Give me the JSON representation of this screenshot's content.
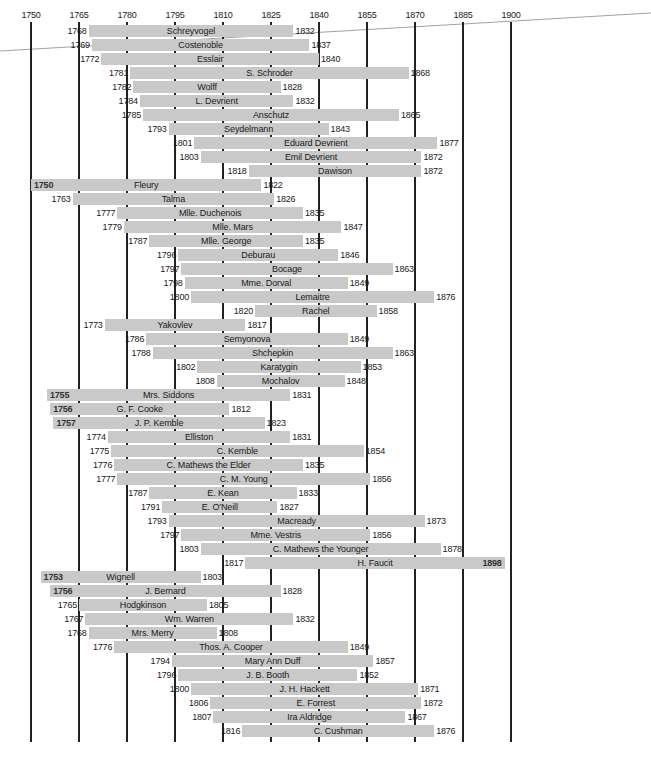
{
  "chart_data": {
    "type": "bar",
    "orientation": "horizontal-range (Gantt/lifespan timeline)",
    "title": "",
    "xlabel": "",
    "ylabel": "",
    "xlim": [
      1750,
      1900
    ],
    "x_ticks": [
      1750,
      1765,
      1780,
      1795,
      1810,
      1825,
      1840,
      1855,
      1870,
      1885,
      1900
    ],
    "grid": "vertical lines at each tick",
    "bar_color": "#c9c9c9",
    "legend": null,
    "rows": [
      {
        "name": "Schreyvogel",
        "start": 1768,
        "end": 1832
      },
      {
        "name": "Costenoble",
        "start": 1769,
        "end": 1837
      },
      {
        "name": "Esslair",
        "start": 1772,
        "end": 1840
      },
      {
        "name": "S. Schroder",
        "start": 1781,
        "end": 1868
      },
      {
        "name": "Wolff",
        "start": 1782,
        "end": 1828
      },
      {
        "name": "L. Devrient",
        "start": 1784,
        "end": 1832
      },
      {
        "name": "Anschutz",
        "start": 1785,
        "end": 1865
      },
      {
        "name": "Seydelmann",
        "start": 1793,
        "end": 1843
      },
      {
        "name": "Eduard Devrient",
        "start": 1801,
        "end": 1877
      },
      {
        "name": "Emil Devrient",
        "start": 1803,
        "end": 1872
      },
      {
        "name": "Dawison",
        "start": 1818,
        "end": 1872
      },
      {
        "name": "Fleury",
        "start": 1750,
        "end": 1822,
        "start_inside": true
      },
      {
        "name": "Talma",
        "start": 1763,
        "end": 1826
      },
      {
        "name": "Mlle. Duchenois",
        "start": 1777,
        "end": 1835
      },
      {
        "name": "Mlle. Mars",
        "start": 1779,
        "end": 1847
      },
      {
        "name": "Mlle. George",
        "start": 1787,
        "end": 1835
      },
      {
        "name": "Deburau",
        "start": 1796,
        "end": 1846
      },
      {
        "name": "Bocage",
        "start": 1797,
        "end": 1863
      },
      {
        "name": "Mme. Dorval",
        "start": 1798,
        "end": 1849
      },
      {
        "name": "Lemaitre",
        "start": 1800,
        "end": 1876
      },
      {
        "name": "Rachel",
        "start": 1820,
        "end": 1858
      },
      {
        "name": "Yakovlev",
        "start": 1773,
        "end": 1817
      },
      {
        "name": "Semyonova",
        "start": 1786,
        "end": 1849
      },
      {
        "name": "Shchepkin",
        "start": 1788,
        "end": 1863
      },
      {
        "name": "Karatygin",
        "start": 1802,
        "end": 1853
      },
      {
        "name": "Mochalov",
        "start": 1808,
        "end": 1848
      },
      {
        "name": "Mrs. Siddons",
        "start": 1755,
        "end": 1831,
        "start_inside": true
      },
      {
        "name": "G. F. Cooke",
        "start": 1756,
        "end": 1812,
        "start_inside": true
      },
      {
        "name": "J. P. Kemble",
        "start": 1757,
        "end": 1823,
        "start_inside": true
      },
      {
        "name": "Elliston",
        "start": 1774,
        "end": 1831
      },
      {
        "name": "C. Kemble",
        "start": 1775,
        "end": 1854
      },
      {
        "name": "C. Mathews the Elder",
        "start": 1776,
        "end": 1835
      },
      {
        "name": "C. M. Young",
        "start": 1777,
        "end": 1856
      },
      {
        "name": "E. Kean",
        "start": 1787,
        "end": 1833
      },
      {
        "name": "E. O'Neill",
        "start": 1791,
        "end": 1827
      },
      {
        "name": "Macready",
        "start": 1793,
        "end": 1873
      },
      {
        "name": "Mme. Vestris",
        "start": 1797,
        "end": 1856
      },
      {
        "name": "C. Mathews the Younger",
        "start": 1803,
        "end": 1878
      },
      {
        "name": "H. Faucit",
        "start": 1817,
        "end": 1898,
        "end_inside": true
      },
      {
        "name": "Wignell",
        "start": 1753,
        "end": 1803,
        "start_inside": true
      },
      {
        "name": "J. Bernard",
        "start": 1756,
        "end": 1828,
        "start_inside": true
      },
      {
        "name": "Hodgkinson",
        "start": 1765,
        "end": 1805
      },
      {
        "name": "Wm. Warren",
        "start": 1767,
        "end": 1832
      },
      {
        "name": "Mrs. Merry",
        "start": 1768,
        "end": 1808
      },
      {
        "name": "Thos. A. Cooper",
        "start": 1776,
        "end": 1849
      },
      {
        "name": "Mary Ann Duff",
        "start": 1794,
        "end": 1857
      },
      {
        "name": "J. B. Booth",
        "start": 1796,
        "end": 1852
      },
      {
        "name": "J. H. Hackett",
        "start": 1800,
        "end": 1871
      },
      {
        "name": "E. Forrest",
        "start": 1806,
        "end": 1872
      },
      {
        "name": "Ira Aldridge",
        "start": 1807,
        "end": 1867
      },
      {
        "name": "C. Cushman",
        "start": 1816,
        "end": 1876
      }
    ]
  }
}
